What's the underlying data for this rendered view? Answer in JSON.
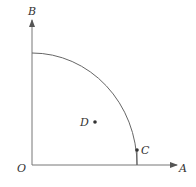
{
  "diagram": {
    "type": "quarter-circle-geometry",
    "labels": {
      "O": "O",
      "A": "A",
      "B": "B",
      "C": "C",
      "D": "D"
    },
    "colors": {
      "line": "#555555",
      "text": "#333333"
    }
  }
}
